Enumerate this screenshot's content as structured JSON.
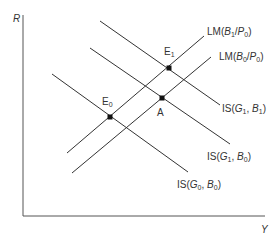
{
  "diagram": {
    "type": "IS-LM diagram",
    "axes": {
      "y_label": "R",
      "x_label": "Y"
    },
    "curves": [
      {
        "id": "lm-b1-p0",
        "kind": "LM",
        "label_prefix": "LM",
        "label_args": "B1/P0",
        "x1": 67,
        "y1": 153,
        "x2": 204,
        "y2": 36
      },
      {
        "id": "lm-b0-p0",
        "kind": "LM",
        "label_prefix": "LM",
        "label_args": "B0/P0",
        "x1": 72,
        "y1": 173,
        "x2": 211,
        "y2": 57
      },
      {
        "id": "is-g1-b1",
        "kind": "IS",
        "label_prefix": "IS",
        "label_args": "G1, B1",
        "x1": 100,
        "y1": 21,
        "x2": 220,
        "y2": 105
      },
      {
        "id": "is-g1-b0",
        "kind": "IS",
        "label_prefix": "IS",
        "label_args": "G1, B0",
        "x1": 90,
        "y1": 48,
        "x2": 230,
        "y2": 144
      },
      {
        "id": "is-g0-b0",
        "kind": "IS",
        "label_prefix": "IS",
        "label_args": "G0, B0",
        "x1": 52,
        "y1": 74,
        "x2": 188,
        "y2": 172
      }
    ],
    "points": [
      {
        "id": "E1",
        "label": "E",
        "sub": "1",
        "x": 169,
        "y": 68
      },
      {
        "id": "A",
        "label": "A",
        "sub": "",
        "x": 162,
        "y": 98
      },
      {
        "id": "E0",
        "label": "E",
        "sub": "0",
        "x": 110,
        "y": 117
      }
    ],
    "labels": {
      "lm_b1": {
        "prefix": "LM",
        "a": "B",
        "a_sub": "1",
        "b": "P",
        "b_sub": "0"
      },
      "lm_b0": {
        "prefix": "LM",
        "a": "B",
        "a_sub": "0",
        "b": "P",
        "b_sub": "0"
      },
      "is_g1_b1": {
        "prefix": "IS",
        "a": "G",
        "a_sub": "1",
        "b": "B",
        "b_sub": "1"
      },
      "is_g1_b0": {
        "prefix": "IS",
        "a": "G",
        "a_sub": "1",
        "b": "B",
        "b_sub": "0"
      },
      "is_g0_b0": {
        "prefix": "IS",
        "a": "G",
        "a_sub": "0",
        "b": "B",
        "b_sub": "0"
      },
      "e1": {
        "main": "E",
        "sub": "1"
      },
      "a": {
        "main": "A"
      },
      "e0": {
        "main": "E",
        "sub": "0"
      }
    },
    "colors": {
      "line": "#333333",
      "point": "#111111"
    }
  }
}
